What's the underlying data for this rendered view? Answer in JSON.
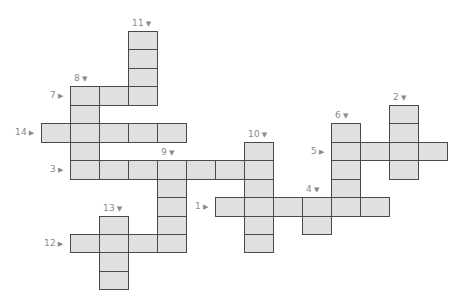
{
  "puzzle": {
    "type": "crossword",
    "grid": {
      "origin_x": 41,
      "origin_y": 31,
      "cell_w": 29,
      "cell_h": 18.45
    },
    "colors": {
      "cell_fill": "#e0e0e0",
      "cell_border": "#4a4a4a",
      "label": "#8a8a8a",
      "background": "#ffffff"
    },
    "entries": [
      {
        "number": "1",
        "direction": "across",
        "arrow": "▶",
        "row": 9,
        "col": 6,
        "length": 6
      },
      {
        "number": "2",
        "direction": "down",
        "arrow": "▼",
        "row": 4,
        "col": 12,
        "length": 4
      },
      {
        "number": "3",
        "direction": "across",
        "arrow": "▶",
        "row": 7,
        "col": 1,
        "length": 7
      },
      {
        "number": "4",
        "direction": "down",
        "arrow": "▼",
        "row": 9,
        "col": 9,
        "length": 2
      },
      {
        "number": "5",
        "direction": "across",
        "arrow": "▶",
        "row": 6,
        "col": 10,
        "length": 4
      },
      {
        "number": "6",
        "direction": "down",
        "arrow": "▼",
        "row": 5,
        "col": 10,
        "length": 5
      },
      {
        "number": "7",
        "direction": "across",
        "arrow": "▶",
        "row": 3,
        "col": 1,
        "length": 3
      },
      {
        "number": "8",
        "direction": "down",
        "arrow": "▼",
        "row": 3,
        "col": 1,
        "length": 5
      },
      {
        "number": "9",
        "direction": "down",
        "arrow": "▼",
        "row": 7,
        "col": 4,
        "length": 5
      },
      {
        "number": "10",
        "direction": "down",
        "arrow": "▼",
        "row": 6,
        "col": 7,
        "length": 6
      },
      {
        "number": "11",
        "direction": "down",
        "arrow": "▼",
        "row": 0,
        "col": 3,
        "length": 4
      },
      {
        "number": "12",
        "direction": "across",
        "arrow": "▶",
        "row": 11,
        "col": 1,
        "length": 4
      },
      {
        "number": "13",
        "direction": "down",
        "arrow": "▼",
        "row": 10,
        "col": 2,
        "length": 4
      },
      {
        "number": "14",
        "direction": "across",
        "arrow": "▶",
        "row": 5,
        "col": 0,
        "length": 5
      }
    ]
  }
}
